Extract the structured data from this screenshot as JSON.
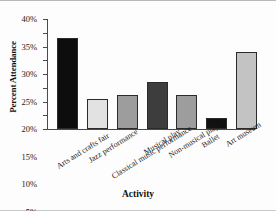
{
  "chart_data": {
    "type": "bar",
    "title": "",
    "xlabel": "Activity",
    "ylabel": "Percent Attendance",
    "categories": [
      "Arts and crafts fair",
      "Jazz performance",
      "Classical music performance",
      "Musical play",
      "Non-musical play",
      "Ballet",
      "Art museum"
    ],
    "values": [
      33,
      11,
      12.5,
      17,
      12.5,
      4,
      28
    ],
    "ylim": [
      0,
      40
    ],
    "ytick_values": [
      0,
      5,
      10,
      15,
      20,
      25,
      30,
      35,
      40
    ],
    "ytick_labels": [
      "0%",
      "5%",
      "10%",
      "15%",
      "20%",
      "25%",
      "30%",
      "35%",
      "40%"
    ],
    "grid": false,
    "legend": false,
    "bar_colors": [
      "#0d0d0d",
      "#e2e2e2",
      "#9d9d9d",
      "#3d3d3d",
      "#9d9d9d",
      "#111111",
      "#c3c3c3"
    ],
    "axis_color": "#4a4a4a"
  }
}
